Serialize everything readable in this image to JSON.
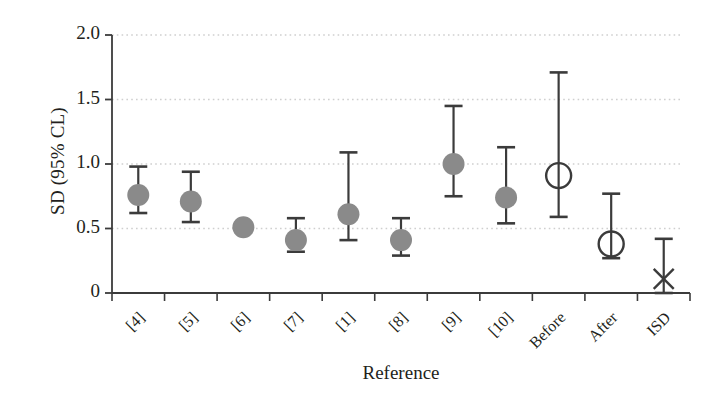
{
  "chart_data": {
    "type": "scatter",
    "title": "",
    "xlabel": "Reference",
    "ylabel": "SD (95% CL)",
    "ylim": [
      0,
      2.0
    ],
    "yticks": [
      0,
      0.5,
      1.0,
      1.5,
      2.0
    ],
    "ytick_labels": [
      "0",
      "0.5",
      "1.0",
      "1.5",
      "2.0"
    ],
    "grid": true,
    "grid_style": "dotted-horizontal",
    "legend": "none",
    "categories": [
      "[4]",
      "[5]",
      "[6]",
      "[7]",
      "[1]",
      "[8]",
      "[9]",
      "[10]",
      "Before",
      "After",
      "ISD"
    ],
    "values": [
      0.76,
      0.71,
      0.51,
      0.41,
      0.61,
      0.41,
      1.0,
      0.74,
      0.91,
      0.38,
      0.11
    ],
    "ci_low": [
      0.62,
      0.55,
      0.51,
      0.32,
      0.41,
      0.29,
      0.75,
      0.54,
      0.59,
      0.27,
      0.0
    ],
    "ci_high": [
      0.98,
      0.94,
      0.51,
      0.58,
      1.09,
      0.58,
      1.45,
      1.13,
      1.71,
      0.77,
      0.42
    ],
    "marker_styles": [
      "filled-circle",
      "filled-circle",
      "filled-circle",
      "filled-circle",
      "filled-circle",
      "filled-circle",
      "filled-circle",
      "filled-circle",
      "open-circle",
      "open-circle",
      "cross"
    ],
    "series": [
      {
        "name": "SD (95% CL)",
        "values": [
          0.76,
          0.71,
          0.51,
          0.41,
          0.61,
          0.41,
          1.0,
          0.74,
          0.91,
          0.38,
          0.11
        ]
      }
    ],
    "colors": {
      "marker_fill": "#8a8a8a",
      "marker_open_stroke": "#3b3b3b",
      "error_bar": "#3b3b3b",
      "axis": "#3b3b3b",
      "grid": "#cfcfcf",
      "text": "#231f20"
    }
  }
}
